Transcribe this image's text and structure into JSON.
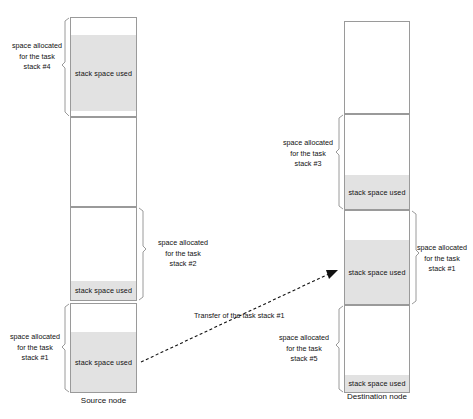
{
  "diagram": {
    "title_text_used": "stack space used",
    "source_node_label": "Source node",
    "destination_node_label": "Destination node",
    "transfer_label": "Transfer of the task stack #1",
    "colors": {
      "used_fill": "#e2e2e2",
      "box_stroke": "#9a9a9a",
      "text": "#111111",
      "background": "#ffffff"
    }
  },
  "source_node": {
    "name": "Source node",
    "blocks": [
      {
        "id": "source-stack-4",
        "allocation_label": "space allocated\nfor the task\nstack #4",
        "allocation_line1": "space allocated",
        "allocation_line2": "for the task",
        "allocation_line3": "stack #4",
        "used_label": "stack space used",
        "brace_side": "left"
      },
      {
        "id": "source-stack-2",
        "allocation_label": "space allocated\nfor the task\nstack #2",
        "allocation_line1": "space allocated",
        "allocation_line2": "for the task",
        "allocation_line3": "stack #2",
        "used_label": "stack space used",
        "brace_side": "right"
      },
      {
        "id": "source-stack-1",
        "allocation_label": "space allocated\nfor the task\nstack #1",
        "allocation_line1": "space allocated",
        "allocation_line2": "for the task",
        "allocation_line3": "stack #1",
        "used_label": "stack space used",
        "brace_side": "left"
      }
    ]
  },
  "destination_node": {
    "name": "Destination node",
    "blocks": [
      {
        "id": "destination-empty-top",
        "allocation_label": "",
        "used_label": "",
        "brace_side": "none"
      },
      {
        "id": "destination-stack-3",
        "allocation_label": "space allocated\nfor the task\nstack #3",
        "allocation_line1": "space allocated",
        "allocation_line2": "for the task",
        "allocation_line3": "stack #3",
        "used_label": "stack space used",
        "brace_side": "left"
      },
      {
        "id": "destination-stack-1",
        "allocation_label": "space allocated\nfor the task\nstack #1",
        "allocation_line1": "space allocated",
        "allocation_line2": "for the task",
        "allocation_line3": "stack #1",
        "used_label": "stack space used",
        "brace_side": "right"
      },
      {
        "id": "destination-stack-5",
        "allocation_label": "space allocated\nfor the task\nstack #5",
        "allocation_line1": "space allocated",
        "allocation_line2": "for the task",
        "allocation_line3": "stack #5",
        "used_label": "stack space used",
        "brace_side": "left"
      }
    ]
  }
}
